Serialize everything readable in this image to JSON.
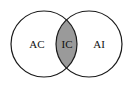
{
  "diagram": {
    "type": "venn",
    "sets": [
      {
        "label": "AC",
        "cx": 44,
        "cy": 44,
        "r": 33
      },
      {
        "label": "AI",
        "cx": 89,
        "cy": 44,
        "r": 33
      }
    ],
    "intersection": {
      "label": "IC",
      "fill": "#9a9a9a"
    },
    "stroke": "#1a1a1a",
    "background": "#ffffff"
  }
}
